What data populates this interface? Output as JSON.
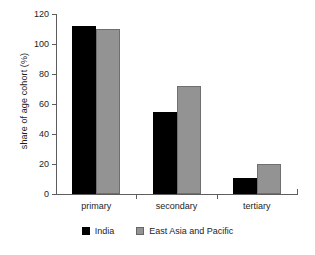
{
  "chart_data": {
    "type": "bar",
    "title": "",
    "xlabel": "",
    "ylabel": "share of age cohort (%)",
    "categories": [
      "primary",
      "secondary",
      "tertiary"
    ],
    "series": [
      {
        "name": "India",
        "color": "#000000",
        "values": [
          112,
          55,
          11
        ]
      },
      {
        "name": "East Asia and Pacific",
        "color": "#939393",
        "values": [
          110,
          72,
          20
        ]
      }
    ],
    "ylim": [
      0,
      120
    ],
    "yticks": [
      0,
      20,
      40,
      60,
      80,
      100,
      120
    ],
    "ytick_labels": [
      "0",
      "20",
      "40",
      "60",
      "80",
      "100",
      "120"
    ],
    "grid": false,
    "legend_position": "bottom-center"
  }
}
